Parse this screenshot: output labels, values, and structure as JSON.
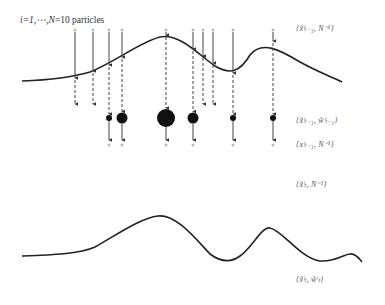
{
  "title": {
    "text": "i=1,⋯,N=10 particles",
    "italic_part": "i=1,⋯,N",
    "plain_part": "=10 particles"
  },
  "stage_labels": [
    {
      "id": "prior-particles",
      "text": "{x̃ⁱₜ₋₁, N⁻¹}",
      "y": 30
    },
    {
      "id": "weighted-prior",
      "text": "{x̃ⁱₜ₋₁, w̃ⁱₜ₋₁}",
      "y": 122
    },
    {
      "id": "resampled",
      "text": "{xⁱₜ₋₁, N⁻¹}",
      "y": 146
    },
    {
      "id": "predicted",
      "text": "{x̃ⁱₜ, N⁻¹}",
      "y": 186
    },
    {
      "id": "weighted-posterior",
      "text": "{x̃ⁱₜ, w̃ⁱₜ}",
      "y": 281
    }
  ],
  "colors": {
    "line": "#222222",
    "arrow": "#444444",
    "particle_fill": "#111111",
    "particle_empty": "#bbbbbb",
    "text": "#444444"
  },
  "top_particles_x": [
    75,
    93,
    109,
    122,
    166,
    193,
    203,
    213,
    233,
    273
  ],
  "top_weights_r": [
    0,
    0,
    3,
    5.5,
    9,
    5.5,
    0,
    0,
    3,
    3
  ],
  "resampled_x": [
    109,
    122,
    166,
    193,
    233,
    273
  ],
  "bottom_particles_x": [
    106,
    123,
    133,
    159,
    166,
    180,
    190,
    200,
    233,
    270
  ],
  "bottom_weights_r": [
    0,
    2.5,
    2.5,
    0,
    5,
    5,
    2.5,
    2.5,
    0,
    5
  ]
}
